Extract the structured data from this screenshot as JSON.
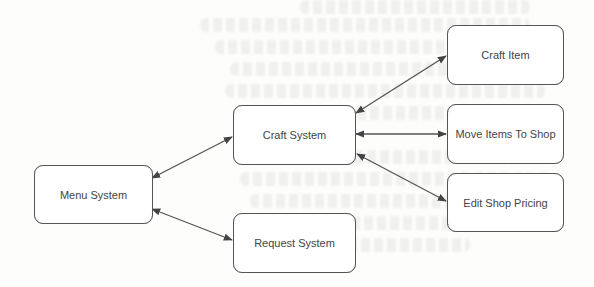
{
  "diagram": {
    "type": "flowchart",
    "nodes": [
      {
        "id": "menu_system",
        "label": "Menu System"
      },
      {
        "id": "craft_system",
        "label": "Craft System"
      },
      {
        "id": "request_system",
        "label": "Request System"
      },
      {
        "id": "craft_item",
        "label": "Craft Item"
      },
      {
        "id": "move_items_to_shop",
        "label": "Move Items To Shop"
      },
      {
        "id": "edit_shop_pricing",
        "label": "Edit Shop Pricing"
      }
    ],
    "edges": [
      {
        "from": "menu_system",
        "to": "craft_system",
        "direction": "bidirectional"
      },
      {
        "from": "menu_system",
        "to": "request_system",
        "direction": "bidirectional"
      },
      {
        "from": "craft_system",
        "to": "craft_item",
        "direction": "bidirectional"
      },
      {
        "from": "craft_system",
        "to": "move_items_to_shop",
        "direction": "bidirectional"
      },
      {
        "from": "craft_system",
        "to": "edit_shop_pricing",
        "direction": "bidirectional"
      }
    ],
    "colors": {
      "stroke": "#555555",
      "text": "#444444",
      "background": "#fdfdfc"
    }
  }
}
